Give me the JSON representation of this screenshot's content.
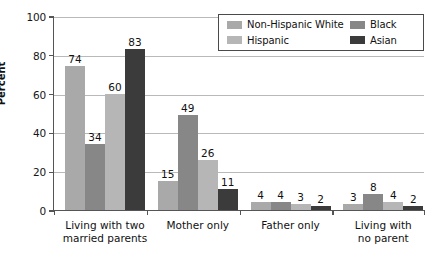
{
  "chart_data": {
    "type": "bar",
    "title": "",
    "subtitle": "",
    "xlabel": "",
    "ylabel": "Percent",
    "ylim": [
      0,
      100
    ],
    "yticks": [
      0,
      20,
      40,
      60,
      80,
      100
    ],
    "grid": true,
    "legend_position": "top-right",
    "categories": [
      "Living with two married parents",
      "Mother only",
      "Father only",
      "Living with no parent"
    ],
    "category_lines": [
      [
        "Living with two",
        "married parents"
      ],
      [
        "Mother only"
      ],
      [
        "Father only"
      ],
      [
        "Living with",
        "no parent"
      ]
    ],
    "series": [
      {
        "name": "Non-Hispanic White",
        "color": "#a9a9a9",
        "values": [
          74,
          15,
          4,
          3
        ]
      },
      {
        "name": "Black",
        "color": "#878787",
        "values": [
          34,
          49,
          4,
          8
        ]
      },
      {
        "name": "Hispanic",
        "color": "#b6b6b6",
        "values": [
          60,
          26,
          3,
          4
        ]
      },
      {
        "name": "Asian",
        "color": "#3b3b3b",
        "values": [
          83,
          11,
          2,
          2
        ]
      }
    ],
    "legend_entries": [
      {
        "label": "Non-Hispanic White",
        "color": "#a9a9a9"
      },
      {
        "label": "Black",
        "color": "#878787"
      },
      {
        "label": "Hispanic",
        "color": "#b6b6b6"
      },
      {
        "label": "Asian",
        "color": "#3b3b3b"
      }
    ],
    "axis_color": "#555555",
    "grid_color": "#b9b9b9",
    "background": "#ffffff"
  }
}
